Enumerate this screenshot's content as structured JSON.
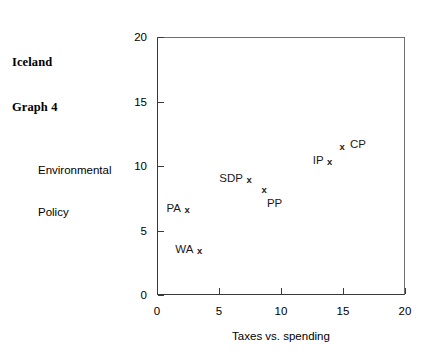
{
  "chart_data": {
    "type": "scatter",
    "title": "Iceland\nGraph 4",
    "title_lines": [
      "Iceland",
      "Graph 4"
    ],
    "xlabel": "Taxes vs. spending",
    "ylabel": "Environmental Policy",
    "ylabel_lines": [
      "Environmental",
      "Policy"
    ],
    "xlim": [
      0,
      20
    ],
    "ylim": [
      0,
      20
    ],
    "xticks": [
      "0",
      "5",
      "10",
      "15",
      "20"
    ],
    "yticks": [
      "0",
      "5",
      "10",
      "15",
      "20"
    ],
    "xtick_values": [
      0,
      5,
      10,
      15,
      20
    ],
    "ytick_values": [
      0,
      5,
      10,
      15,
      20
    ],
    "grid": false,
    "legend": "none",
    "marker": "x",
    "marker_color": "#1a1a1a",
    "axis_color": "#3a3a3a",
    "points": [
      {
        "label": "PA",
        "x": 2.5,
        "y": 6.5,
        "label_pos": "left"
      },
      {
        "label": "WA",
        "x": 3.5,
        "y": 3.3,
        "label_pos": "left"
      },
      {
        "label": "SDP",
        "x": 7.5,
        "y": 8.8,
        "label_pos": "left"
      },
      {
        "label": "PP",
        "x": 8.7,
        "y": 8.1,
        "label_pos": "below"
      },
      {
        "label": "IP",
        "x": 14.0,
        "y": 10.2,
        "label_pos": "left"
      },
      {
        "label": "CP",
        "x": 15.0,
        "y": 11.4,
        "label_pos": "right"
      }
    ]
  }
}
